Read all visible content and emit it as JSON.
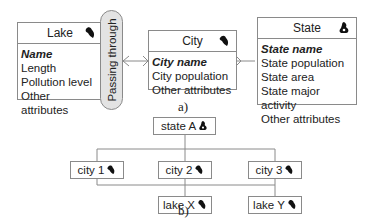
{
  "figure_a": {
    "caption": "a)",
    "lake": {
      "title": "Lake",
      "key_attribute": "Name",
      "attributes": [
        "Length",
        "Pollution level",
        "Other attributes"
      ],
      "icon": "lake-icon"
    },
    "relationship": {
      "label": "Passing through"
    },
    "city": {
      "title": "City",
      "key_attribute": "City name",
      "attributes": [
        "City population",
        "Other attributes"
      ],
      "icon": "city-icon"
    },
    "state": {
      "title": "State",
      "key_attribute": "State name",
      "attributes": [
        "State population",
        "State area",
        "State major activity",
        "Other attributes"
      ],
      "icon": "state-icon"
    }
  },
  "figure_b": {
    "caption": "b)",
    "root": {
      "label": "state A",
      "icon": "state-icon"
    },
    "cities": [
      {
        "label": "city 1",
        "icon": "city-icon"
      },
      {
        "label": "city 2",
        "icon": "city-icon"
      },
      {
        "label": "city 3",
        "icon": "city-icon"
      }
    ],
    "lakes": [
      {
        "label": "lake X",
        "icon": "lake-icon"
      },
      {
        "label": "lake Y",
        "icon": "lake-icon"
      }
    ]
  },
  "colors": {
    "border": "#8a8a8a",
    "pill_fill": "#e3e3e3",
    "text": "#222222"
  }
}
